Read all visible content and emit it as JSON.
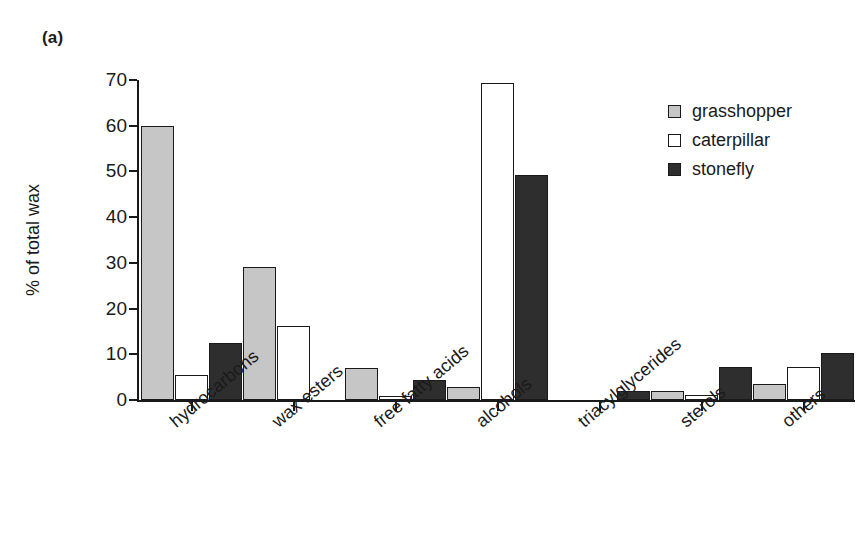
{
  "figure": {
    "panel_label": "(a)"
  },
  "legend": {
    "position": "top-right",
    "entries": [
      {
        "label": "grasshopper",
        "color": "#c6c6c6",
        "key": "grasshopper"
      },
      {
        "label": "caterpillar",
        "color": "#ffffff",
        "key": "caterpillar"
      },
      {
        "label": "stonefly",
        "color": "#2e2e2e",
        "key": "stonefly"
      }
    ]
  },
  "axes": {
    "ylabel": "% of total wax",
    "xlabel": "",
    "yticks": [
      "0",
      "10",
      "20",
      "30",
      "40",
      "50",
      "60",
      "70"
    ],
    "ylim": [
      0,
      70
    ],
    "grid": false
  },
  "chart_data": {
    "type": "bar",
    "title": "",
    "subtitle": "",
    "xlabel": "",
    "ylabel": "% of total wax",
    "ylim": [
      0,
      70
    ],
    "yticks": [
      0,
      10,
      20,
      30,
      40,
      50,
      60,
      70
    ],
    "grid": false,
    "legend_position": "top-right",
    "annotations": [
      "(a)"
    ],
    "categories": [
      "hydrocarbons",
      "wax esters",
      "free fatty acids",
      "alcohols",
      "triacylglycerides",
      "sterols",
      "others"
    ],
    "series": [
      {
        "name": "grasshopper",
        "color": "#c6c6c6",
        "values": [
          60.0,
          29.0,
          7.0,
          2.8,
          0.0,
          2.0,
          3.5
        ]
      },
      {
        "name": "caterpillar",
        "color": "#ffffff",
        "values": [
          5.5,
          16.3,
          0.8,
          69.3,
          0.0,
          1.0,
          7.3
        ]
      },
      {
        "name": "stonefly",
        "color": "#2e2e2e",
        "values": [
          12.5,
          0.0,
          4.3,
          49.3,
          2.0,
          7.3,
          10.2
        ]
      }
    ],
    "bar_order_note": "within each category the drawn order is grasshopper, caterpillar, stonefly"
  }
}
